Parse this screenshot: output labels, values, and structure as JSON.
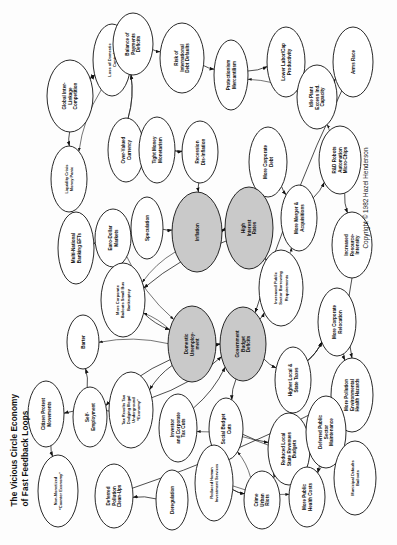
{
  "title": {
    "line1": "The Vicious Circle Economy",
    "line2": "of Fast Feedback Loops"
  },
  "copyright": "Copyright © 1982 Hazel Henderson",
  "legend": {
    "shaded_meaning": "core feedback variable"
  },
  "chart_data": {
    "type": "diagram",
    "subtype": "causal-loop-feedback-network",
    "orientation": "rotated-90-ccw",
    "title": "The Vicious Circle Economy of Fast Feedback Loops",
    "credit": "Copyright © 1982 Hazel Henderson",
    "node_shape": "ellipse",
    "edge_style": "directed-arrow",
    "highlighted_nodes": [
      "Inflation",
      "High Interest Rates",
      "Domestic Unemployment",
      "Government Budget Deficits"
    ],
    "nodes": [
      {
        "id": "n1",
        "label": "Global Inter-\nLinkage\nCompetition",
        "cx": 70,
        "cy": 96,
        "rx": 23,
        "ry": 36,
        "shaded": false
      },
      {
        "id": "n2",
        "label": "Loss of Domestic\nControl",
        "cx": 112,
        "cy": 60,
        "rx": 19,
        "ry": 36,
        "shaded": false
      },
      {
        "id": "n3",
        "label": "Balance of\nPayments\nDeficits",
        "cx": 133,
        "cy": 44,
        "rx": 20,
        "ry": 31,
        "shaded": false
      },
      {
        "id": "n4",
        "label": "Risk of\nInternational\nDebt Defaults",
        "cx": 182,
        "cy": 58,
        "rx": 22,
        "ry": 35,
        "shaded": false
      },
      {
        "id": "n5",
        "label": "Protectionism\nMercantilism",
        "cx": 231,
        "cy": 75,
        "rx": 17,
        "ry": 35,
        "shaded": false
      },
      {
        "id": "n6",
        "label": "Lower Labor/Cap\nProductivity",
        "cx": 286,
        "cy": 62,
        "rx": 19,
        "ry": 35,
        "shaded": false
      },
      {
        "id": "n7",
        "label": "Idle Plant\nExcess Ind.\nCapacity",
        "cx": 317,
        "cy": 97,
        "rx": 20,
        "ry": 32,
        "shaded": false
      },
      {
        "id": "n8",
        "label": "Arms Race",
        "cx": 353,
        "cy": 62,
        "rx": 20,
        "ry": 35,
        "shaded": false
      },
      {
        "id": "n9",
        "label": "Liquidity Crisis\nMoney Panic",
        "cx": 69,
        "cy": 179,
        "rx": 18,
        "ry": 33,
        "shaded": false
      },
      {
        "id": "n10",
        "label": "Over-Valued\nCurrency",
        "cx": 126,
        "cy": 150,
        "rx": 18,
        "ry": 32,
        "shaded": false
      },
      {
        "id": "n11",
        "label": "Tight Money\nMonetarism",
        "cx": 157,
        "cy": 150,
        "rx": 18,
        "ry": 33,
        "shaded": false
      },
      {
        "id": "n12",
        "label": "Recession\nDis-Inflation",
        "cx": 200,
        "cy": 152,
        "rx": 18,
        "ry": 31,
        "shaded": false
      },
      {
        "id": "n13",
        "label": "More Corporate\nDebt",
        "cx": 268,
        "cy": 162,
        "rx": 19,
        "ry": 35,
        "shaded": false
      },
      {
        "id": "n14",
        "label": "R&D Robots\nAutomation\nMicro-Chips",
        "cx": 340,
        "cy": 160,
        "rx": 21,
        "ry": 34,
        "shaded": false
      },
      {
        "id": "n15",
        "label": "Multi-National\nBanking EFTs",
        "cx": 76,
        "cy": 248,
        "rx": 18,
        "ry": 36,
        "shaded": false
      },
      {
        "id": "n16",
        "label": "Euro-Dollar\nMarkets",
        "cx": 113,
        "cy": 238,
        "rx": 18,
        "ry": 29,
        "shaded": false
      },
      {
        "id": "n17",
        "label": "Speculation",
        "cx": 147,
        "cy": 228,
        "rx": 16,
        "ry": 31,
        "shaded": false
      },
      {
        "id": "n18",
        "label": "Inflation",
        "cx": 197,
        "cy": 232,
        "rx": 25,
        "ry": 40,
        "shaded": true
      },
      {
        "id": "n19",
        "label": "High\nInterest\nRates",
        "cx": 249,
        "cy": 228,
        "rx": 24,
        "ry": 41,
        "shaded": true
      },
      {
        "id": "n20",
        "label": "More Merger &\nAcquisitions",
        "cx": 299,
        "cy": 218,
        "rx": 18,
        "ry": 33,
        "shaded": false
      },
      {
        "id": "n21",
        "label": "Increased\nResource-\nIntensity",
        "cx": 352,
        "cy": 245,
        "rx": 20,
        "ry": 33,
        "shaded": false
      },
      {
        "id": "n22",
        "label": "More Corporate\nBailouts Small Bus\nBankruptcy",
        "cx": 123,
        "cy": 300,
        "rx": 22,
        "ry": 37,
        "shaded": false
      },
      {
        "id": "n23",
        "label": "Increased Public\nSector Borrowing\nRequirements",
        "cx": 281,
        "cy": 288,
        "rx": 22,
        "ry": 38,
        "shaded": false
      },
      {
        "id": "n24",
        "label": "More Corporate\nRelocation",
        "cx": 337,
        "cy": 322,
        "rx": 19,
        "ry": 34,
        "shaded": false
      },
      {
        "id": "n25",
        "label": "Barter",
        "cx": 83,
        "cy": 342,
        "rx": 16,
        "ry": 27,
        "shaded": false
      },
      {
        "id": "n26",
        "label": "Domestic\nUnemploy-\nment",
        "cx": 192,
        "cy": 344,
        "rx": 24,
        "ry": 38,
        "shaded": true
      },
      {
        "id": "n27",
        "label": "Government\nBudget\nDeficits",
        "cx": 243,
        "cy": 344,
        "rx": 23,
        "ry": 37,
        "shaded": true
      },
      {
        "id": "n28",
        "label": "Higher Local &\nState Taxes",
        "cx": 293,
        "cy": 380,
        "rx": 18,
        "ry": 33,
        "shaded": false
      },
      {
        "id": "n29",
        "label": "More Pollution\nEnvironmental\nHealth Hazards",
        "cx": 352,
        "cy": 395,
        "rx": 21,
        "ry": 37,
        "shaded": false
      },
      {
        "id": "n30",
        "label": "Citizen Protest\nMovements",
        "cx": 46,
        "cy": 414,
        "rx": 18,
        "ry": 33,
        "shaded": false
      },
      {
        "id": "n31",
        "label": "Self-\nEmployment",
        "cx": 90,
        "cy": 417,
        "rx": 17,
        "ry": 30,
        "shaded": false
      },
      {
        "id": "n32",
        "label": "Tax Revolts Tax\nDodging  Illegal\nUnderground\n“Economy”",
        "cx": 131,
        "cy": 410,
        "rx": 22,
        "ry": 38,
        "shaded": false
      },
      {
        "id": "n33",
        "label": "Investor\nand Corporate\nTax Cuts",
        "cx": 178,
        "cy": 428,
        "rx": 19,
        "ry": 34,
        "shaded": false
      },
      {
        "id": "n34",
        "label": "Social Budget\nCuts",
        "cx": 226,
        "cy": 429,
        "rx": 17,
        "ry": 31,
        "shaded": false
      },
      {
        "id": "n35",
        "label": "Reduced Local\nState Revenues\nBudgets",
        "cx": 289,
        "cy": 449,
        "rx": 21,
        "ry": 36,
        "shaded": false
      },
      {
        "id": "n36",
        "label": "Deferred Public\nSector\nMaintenance",
        "cx": 326,
        "cy": 432,
        "rx": 20,
        "ry": 36,
        "shaded": false
      },
      {
        "id": "n37",
        "label": "Non-Monetized\n“Counter Economy”",
        "cx": 58,
        "cy": 491,
        "rx": 20,
        "ry": 36,
        "shaded": false
      },
      {
        "id": "n38",
        "label": "Deferred\nPollution\nClean-Ups",
        "cx": 114,
        "cy": 496,
        "rx": 19,
        "ry": 32,
        "shaded": false
      },
      {
        "id": "n39",
        "label": "Deregulation",
        "cx": 172,
        "cy": 500,
        "rx": 16,
        "ry": 30,
        "shaded": false
      },
      {
        "id": "n40",
        "label": "Reduced Human\nInvestment Services",
        "cx": 214,
        "cy": 483,
        "rx": 19,
        "ry": 38,
        "shaded": false
      },
      {
        "id": "n41",
        "label": "Crime\nUrban\nRiots",
        "cx": 262,
        "cy": 500,
        "rx": 18,
        "ry": 29,
        "shaded": false
      },
      {
        "id": "n42",
        "label": "More Public\nHealth Costs",
        "cx": 307,
        "cy": 497,
        "rx": 18,
        "ry": 30,
        "shaded": false
      },
      {
        "id": "n43",
        "label": "Municipal Defaults\nBailouts",
        "cx": 355,
        "cy": 478,
        "rx": 21,
        "ry": 37,
        "shaded": false
      }
    ],
    "edges": [
      {
        "from": "n1",
        "to": "n2"
      },
      {
        "from": "n2",
        "to": "n3"
      },
      {
        "from": "n3",
        "to": "n4"
      },
      {
        "from": "n4",
        "to": "n5"
      },
      {
        "from": "n5",
        "to": "n6"
      },
      {
        "from": "n6",
        "to": "n7"
      },
      {
        "from": "n7",
        "to": "n8"
      },
      {
        "from": "n2",
        "to": "n1"
      },
      {
        "from": "n1",
        "to": "n9"
      },
      {
        "from": "n9",
        "to": "n15"
      },
      {
        "from": "n10",
        "to": "n3"
      },
      {
        "from": "n11",
        "to": "n10"
      },
      {
        "from": "n11",
        "to": "n12"
      },
      {
        "from": "n12",
        "to": "n18"
      },
      {
        "from": "n18",
        "to": "n19"
      },
      {
        "from": "n19",
        "to": "n18"
      },
      {
        "from": "n19",
        "to": "n13"
      },
      {
        "from": "n13",
        "to": "n20"
      },
      {
        "from": "n20",
        "to": "n14"
      },
      {
        "from": "n14",
        "to": "n21"
      },
      {
        "from": "n16",
        "to": "n17"
      },
      {
        "from": "n17",
        "to": "n18"
      },
      {
        "from": "n15",
        "to": "n16"
      },
      {
        "from": "n19",
        "to": "n22"
      },
      {
        "from": "n22",
        "to": "n26"
      },
      {
        "from": "n26",
        "to": "n27"
      },
      {
        "from": "n27",
        "to": "n23"
      },
      {
        "from": "n23",
        "to": "n19"
      },
      {
        "from": "n27",
        "to": "n28"
      },
      {
        "from": "n28",
        "to": "n24"
      },
      {
        "from": "n24",
        "to": "n29"
      },
      {
        "from": "n26",
        "to": "n31"
      },
      {
        "from": "n31",
        "to": "n25"
      },
      {
        "from": "n26",
        "to": "n32"
      },
      {
        "from": "n32",
        "to": "n27"
      },
      {
        "from": "n30",
        "to": "n37"
      },
      {
        "from": "n33",
        "to": "n27"
      },
      {
        "from": "n34",
        "to": "n35"
      },
      {
        "from": "n35",
        "to": "n41"
      },
      {
        "from": "n36",
        "to": "n43"
      },
      {
        "from": "n40",
        "to": "n41"
      },
      {
        "from": "n39",
        "to": "n38"
      },
      {
        "from": "n42",
        "to": "n35"
      },
      {
        "from": "n29",
        "to": "n42"
      },
      {
        "from": "n35",
        "to": "n36"
      },
      {
        "from": "n27",
        "to": "n34"
      },
      {
        "from": "n34",
        "to": "n40"
      },
      {
        "from": "n32",
        "to": "n30"
      },
      {
        "from": "n8",
        "to": "n27"
      },
      {
        "from": "n21",
        "to": "n29"
      },
      {
        "from": "n38",
        "to": "n29"
      }
    ]
  }
}
